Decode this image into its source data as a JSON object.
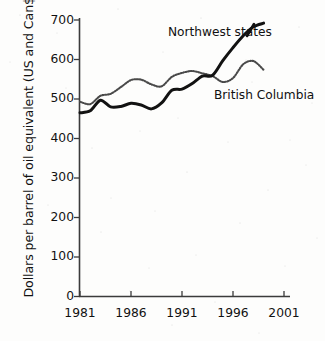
{
  "chart_data": {
    "type": "line",
    "title": "",
    "xlabel": "",
    "ylabel": "Dollars per barrel of oil equivalent (US and Can$)",
    "xlim": [
      1981,
      2001
    ],
    "ylim": [
      0,
      700
    ],
    "grid": false,
    "legend_position": "inline-annotations",
    "xticks": [
      1981,
      1986,
      1991,
      1996,
      2001
    ],
    "xtick_labels": [
      "1981",
      "1986",
      "1991",
      "1996",
      "2001"
    ],
    "yticks": [
      0,
      100,
      200,
      300,
      400,
      500,
      600,
      700
    ],
    "ytick_labels": [
      "0",
      "100",
      "200",
      "300",
      "400",
      "500",
      "600",
      "700"
    ],
    "x": [
      1981,
      1982,
      1983,
      1984,
      1985,
      1986,
      1987,
      1988,
      1989,
      1990,
      1991,
      1992,
      1993,
      1994,
      1995,
      1996,
      1997,
      1998,
      1999
    ],
    "series": [
      {
        "name": "Northwest states",
        "style": "solid",
        "color": "#121212",
        "values": [
          465,
          470,
          497,
          480,
          481,
          489,
          485,
          475,
          490,
          522,
          525,
          539,
          558,
          560,
          597,
          630,
          660,
          683,
          692
        ]
      },
      {
        "name": "British Columbia",
        "style": "dotted",
        "color": "#4a4a4a",
        "values": [
          493,
          487,
          508,
          513,
          530,
          548,
          549,
          537,
          532,
          556,
          566,
          571,
          565,
          558,
          543,
          553,
          588,
          596,
          574
        ]
      }
    ],
    "annotations": [
      {
        "text": "Northwest states",
        "x": 1991.0,
        "y": 672
      },
      {
        "text": "British Columbia",
        "x": 1995.5,
        "y": 512
      }
    ]
  },
  "axis": {
    "y_title": "Dollars per barrel of oil equivalent (US and Can$)"
  },
  "labels": {
    "northwest": "Northwest states",
    "british_columbia": "British Columbia"
  }
}
